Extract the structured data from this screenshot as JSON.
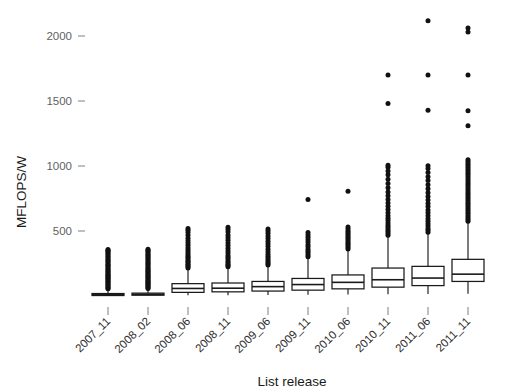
{
  "chart_data": {
    "type": "box",
    "title": "",
    "xlabel": "List release",
    "ylabel": "MFLOPS/W",
    "ylim": [
      0,
      2150
    ],
    "yticks": [
      500,
      1000,
      1500,
      2000
    ],
    "ytick_labels": [
      "500",
      "1000",
      "1500",
      "2000"
    ],
    "grid": false,
    "legend": null,
    "categories": [
      "2007_11",
      "2008_02",
      "2008_06",
      "2008_11",
      "2009_06",
      "2009_11",
      "2010_06",
      "2010_11",
      "2011_06",
      "2011_11"
    ],
    "boxes": [
      {
        "category": "2007_11",
        "whisker_low": 2,
        "q1": 5,
        "median": 11,
        "q3": 19,
        "whisker_high": 42,
        "outliers": [
          55,
          62,
          70,
          78,
          86,
          95,
          103,
          112,
          120,
          129,
          137,
          145,
          152,
          160,
          168,
          176,
          185,
          192,
          200,
          210,
          218,
          228,
          236,
          245,
          255,
          265,
          275,
          285,
          295,
          305,
          315,
          325,
          335,
          345,
          352,
          358
        ]
      },
      {
        "category": "2008_02",
        "whisker_low": 2,
        "q1": 6,
        "median": 13,
        "q3": 22,
        "whisker_high": 48,
        "outliers": [
          58,
          66,
          74,
          82,
          90,
          98,
          106,
          114,
          122,
          130,
          138,
          146,
          154,
          162,
          170,
          178,
          186,
          194,
          202,
          212,
          222,
          232,
          242,
          252,
          262,
          272,
          282,
          292,
          302,
          312,
          322,
          332,
          342,
          352,
          360
        ]
      },
      {
        "category": "2008_06",
        "whisker_low": 6,
        "q1": 28,
        "median": 58,
        "q3": 95,
        "whisker_high": 205,
        "outliers": [
          215,
          225,
          235,
          245,
          255,
          265,
          275,
          290,
          300,
          312,
          325,
          340,
          355,
          372,
          390,
          408,
          425,
          445,
          468,
          488,
          505,
          520
        ]
      },
      {
        "category": "2008_11",
        "whisker_low": 6,
        "q1": 32,
        "median": 60,
        "q3": 100,
        "whisker_high": 215,
        "outliers": [
          225,
          235,
          245,
          258,
          270,
          285,
          298,
          312,
          330,
          348,
          368,
          388,
          408,
          428,
          448,
          468,
          492,
          512,
          528
        ]
      },
      {
        "category": "2009_06",
        "whisker_low": 8,
        "q1": 38,
        "median": 72,
        "q3": 112,
        "whisker_high": 228,
        "outliers": [
          238,
          250,
          262,
          275,
          290,
          305,
          322,
          340,
          360,
          382,
          402,
          422,
          442,
          462,
          482,
          500,
          515
        ]
      },
      {
        "category": "2009_11",
        "whisker_low": 10,
        "q1": 45,
        "median": 88,
        "q3": 135,
        "whisker_high": 292,
        "outliers": [
          302,
          315,
          330,
          345,
          360,
          378,
          395,
          415,
          432,
          452,
          470,
          488,
          742
        ]
      },
      {
        "category": "2010_06",
        "whisker_low": 12,
        "q1": 55,
        "median": 105,
        "q3": 162,
        "whisker_high": 352,
        "outliers": [
          362,
          375,
          388,
          400,
          412,
          425,
          438,
          450,
          462,
          475,
          488,
          500,
          515,
          530,
          805
        ]
      },
      {
        "category": "2010_11",
        "whisker_low": 14,
        "q1": 68,
        "median": 125,
        "q3": 215,
        "whisker_high": 455,
        "outliers": [
          468,
          482,
          498,
          512,
          528,
          545,
          562,
          580,
          598,
          618,
          640,
          665,
          690,
          715,
          742,
          772,
          800,
          832,
          865,
          898,
          932,
          962,
          990,
          1005,
          1480,
          1700
        ]
      },
      {
        "category": "2011_06",
        "whisker_low": 16,
        "q1": 80,
        "median": 138,
        "q3": 228,
        "whisker_high": 478,
        "outliers": [
          490,
          505,
          520,
          538,
          556,
          575,
          595,
          618,
          640,
          662,
          688,
          712,
          738,
          765,
          795,
          825,
          855,
          888,
          918,
          950,
          980,
          1002,
          1428,
          1700,
          2118
        ]
      },
      {
        "category": "2011_11",
        "whisker_low": 18,
        "q1": 112,
        "median": 168,
        "q3": 282,
        "whisker_high": 562,
        "outliers": [
          575,
          588,
          602,
          616,
          630,
          645,
          660,
          675,
          690,
          705,
          720,
          735,
          750,
          765,
          780,
          795,
          810,
          825,
          840,
          855,
          870,
          885,
          900,
          915,
          930,
          945,
          960,
          975,
          990,
          1005,
          1020,
          1035,
          1048,
          1310,
          1425,
          1700,
          2030,
          2062
        ]
      }
    ]
  },
  "axes": {
    "y_axis_label": "MFLOPS/W",
    "x_axis_label": "List release"
  },
  "colors": {
    "box_stroke": "#1a1a1a",
    "box_fill": "#ffffff",
    "box_fill_dark": "#777777",
    "outlier": "#111111",
    "tick": "#8a8a8a",
    "tick_label": "#5f5f5f",
    "background": "#ffffff"
  }
}
